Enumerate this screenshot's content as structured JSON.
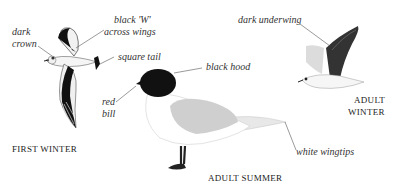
{
  "figures": {
    "first_winter": {
      "caption": "FIRST WINTER",
      "labels": {
        "dark_crown_1": "dark",
        "dark_crown_2": "crown",
        "black_w_1": "black 'W'",
        "black_w_2": "across wings",
        "square_tail": "square tail"
      }
    },
    "adult_summer": {
      "caption": "ADULT SUMMER",
      "labels": {
        "black_hood": "black hood",
        "red_bill_1": "red",
        "red_bill_2": "bill",
        "white_wingtips": "white wingtips"
      }
    },
    "adult_winter": {
      "caption_1": "ADULT",
      "caption_2": "WINTER",
      "labels": {
        "dark_underwing": "dark underwing"
      }
    }
  },
  "colors": {
    "background": "#ffffff",
    "black_plumage": "#111111",
    "grey_mantle": "#c9c9c9",
    "leader_line": "#555555"
  }
}
